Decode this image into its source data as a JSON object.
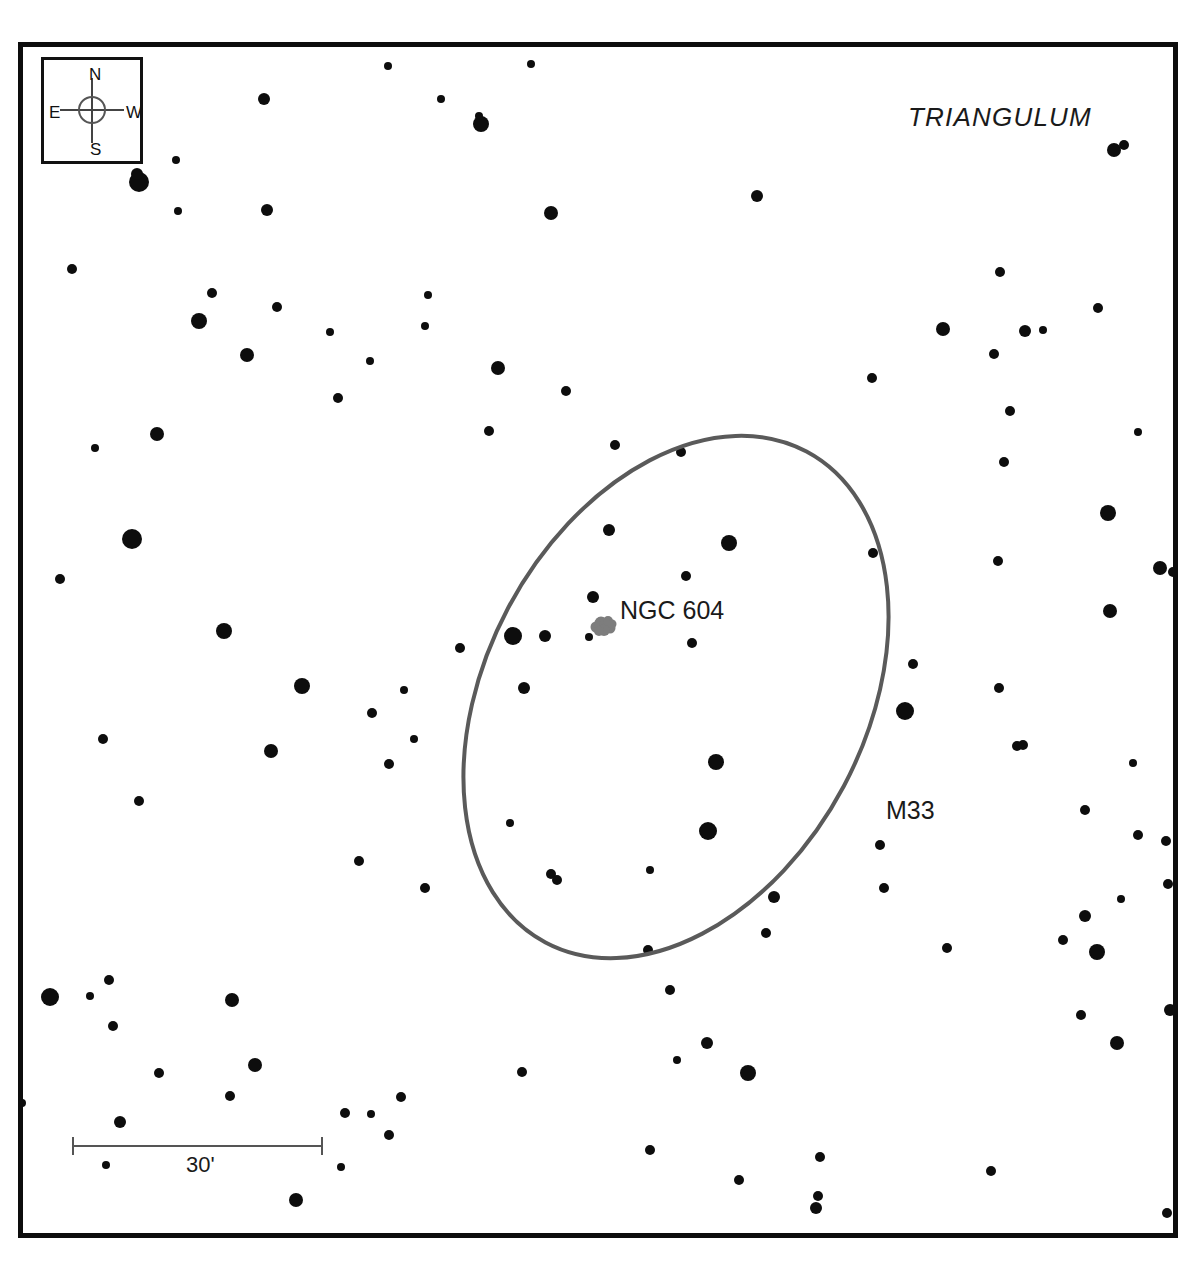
{
  "chart_data": {
    "type": "scatter",
    "title": "",
    "subtitle": "",
    "xlabel": "",
    "ylabel": "",
    "grid": false,
    "legend": "none",
    "field_size": "30 arcmin scale bar",
    "labels": {
      "constellation": "TRIANGULUM",
      "nebula": "NGC 604",
      "galaxy": "M33"
    },
    "compass": {
      "north": "N",
      "south": "S",
      "east": "E",
      "west": "W"
    },
    "scale": {
      "length_label": "30'",
      "pixel_length": 251
    },
    "colors": {
      "star": "#0d0d0d",
      "galaxy_outline": "#5a5a5a",
      "nebula": "#7d7d7d",
      "frame": "#0d0d0d",
      "background": "#ffffff",
      "text": "#1a1a1a"
    },
    "galaxy_ellipse": {
      "center_x": 676,
      "center_y": 697,
      "radius_major": 278,
      "radius_minor": 190,
      "rotation_deg": -62,
      "stroke_width": 4
    },
    "nebula_blob": {
      "x": 604,
      "y": 626
    },
    "stars": [
      {
        "x": 388,
        "y": 66,
        "r": 4
      },
      {
        "x": 531,
        "y": 64,
        "r": 4
      },
      {
        "x": 264,
        "y": 99,
        "r": 6
      },
      {
        "x": 441,
        "y": 99,
        "r": 4
      },
      {
        "x": 481,
        "y": 124,
        "r": 8
      },
      {
        "x": 479,
        "y": 116,
        "r": 4
      },
      {
        "x": 1114,
        "y": 150,
        "r": 7
      },
      {
        "x": 1124,
        "y": 145,
        "r": 5
      },
      {
        "x": 139,
        "y": 182,
        "r": 10
      },
      {
        "x": 137,
        "y": 174,
        "r": 6
      },
      {
        "x": 176,
        "y": 160,
        "r": 4
      },
      {
        "x": 178,
        "y": 211,
        "r": 4
      },
      {
        "x": 267,
        "y": 210,
        "r": 6
      },
      {
        "x": 551,
        "y": 213,
        "r": 7
      },
      {
        "x": 757,
        "y": 196,
        "r": 6
      },
      {
        "x": 72,
        "y": 269,
        "r": 5
      },
      {
        "x": 212,
        "y": 293,
        "r": 5
      },
      {
        "x": 277,
        "y": 307,
        "r": 5
      },
      {
        "x": 428,
        "y": 295,
        "r": 4
      },
      {
        "x": 1000,
        "y": 272,
        "r": 5
      },
      {
        "x": 1098,
        "y": 308,
        "r": 5
      },
      {
        "x": 199,
        "y": 321,
        "r": 8
      },
      {
        "x": 247,
        "y": 355,
        "r": 7
      },
      {
        "x": 370,
        "y": 361,
        "r": 4
      },
      {
        "x": 498,
        "y": 368,
        "r": 7
      },
      {
        "x": 943,
        "y": 329,
        "r": 7
      },
      {
        "x": 1025,
        "y": 331,
        "r": 6
      },
      {
        "x": 1043,
        "y": 330,
        "r": 4
      },
      {
        "x": 330,
        "y": 332,
        "r": 4
      },
      {
        "x": 425,
        "y": 326,
        "r": 4
      },
      {
        "x": 566,
        "y": 391,
        "r": 5
      },
      {
        "x": 872,
        "y": 378,
        "r": 5
      },
      {
        "x": 994,
        "y": 354,
        "r": 5
      },
      {
        "x": 338,
        "y": 398,
        "r": 5
      },
      {
        "x": 489,
        "y": 431,
        "r": 5
      },
      {
        "x": 157,
        "y": 434,
        "r": 7
      },
      {
        "x": 615,
        "y": 445,
        "r": 5
      },
      {
        "x": 681,
        "y": 452,
        "r": 5
      },
      {
        "x": 1010,
        "y": 411,
        "r": 5
      },
      {
        "x": 1138,
        "y": 432,
        "r": 4
      },
      {
        "x": 95,
        "y": 448,
        "r": 4
      },
      {
        "x": 1004,
        "y": 462,
        "r": 5
      },
      {
        "x": 132,
        "y": 539,
        "r": 10
      },
      {
        "x": 609,
        "y": 530,
        "r": 6
      },
      {
        "x": 729,
        "y": 543,
        "r": 8
      },
      {
        "x": 873,
        "y": 553,
        "r": 5
      },
      {
        "x": 1108,
        "y": 513,
        "r": 8
      },
      {
        "x": 1160,
        "y": 568,
        "r": 7
      },
      {
        "x": 1173,
        "y": 572,
        "r": 5
      },
      {
        "x": 60,
        "y": 579,
        "r": 5
      },
      {
        "x": 686,
        "y": 576,
        "r": 5
      },
      {
        "x": 593,
        "y": 597,
        "r": 6
      },
      {
        "x": 998,
        "y": 561,
        "r": 5
      },
      {
        "x": 1110,
        "y": 611,
        "r": 7
      },
      {
        "x": 224,
        "y": 631,
        "r": 8
      },
      {
        "x": 513,
        "y": 636,
        "r": 9
      },
      {
        "x": 545,
        "y": 636,
        "r": 6
      },
      {
        "x": 460,
        "y": 648,
        "r": 5
      },
      {
        "x": 589,
        "y": 637,
        "r": 4
      },
      {
        "x": 692,
        "y": 643,
        "r": 5
      },
      {
        "x": 913,
        "y": 664,
        "r": 5
      },
      {
        "x": 302,
        "y": 686,
        "r": 8
      },
      {
        "x": 404,
        "y": 690,
        "r": 4
      },
      {
        "x": 524,
        "y": 688,
        "r": 6
      },
      {
        "x": 372,
        "y": 713,
        "r": 5
      },
      {
        "x": 905,
        "y": 711,
        "r": 9
      },
      {
        "x": 999,
        "y": 688,
        "r": 5
      },
      {
        "x": 1023,
        "y": 745,
        "r": 5
      },
      {
        "x": 103,
        "y": 739,
        "r": 5
      },
      {
        "x": 271,
        "y": 751,
        "r": 7
      },
      {
        "x": 414,
        "y": 739,
        "r": 4
      },
      {
        "x": 389,
        "y": 764,
        "r": 5
      },
      {
        "x": 716,
        "y": 762,
        "r": 8
      },
      {
        "x": 1017,
        "y": 746,
        "r": 5
      },
      {
        "x": 1133,
        "y": 763,
        "r": 4
      },
      {
        "x": 1085,
        "y": 810,
        "r": 5
      },
      {
        "x": 139,
        "y": 801,
        "r": 5
      },
      {
        "x": 510,
        "y": 823,
        "r": 4
      },
      {
        "x": 708,
        "y": 831,
        "r": 9
      },
      {
        "x": 880,
        "y": 845,
        "r": 5
      },
      {
        "x": 1138,
        "y": 835,
        "r": 5
      },
      {
        "x": 1166,
        "y": 841,
        "r": 5
      },
      {
        "x": 359,
        "y": 861,
        "r": 5
      },
      {
        "x": 425,
        "y": 888,
        "r": 5
      },
      {
        "x": 551,
        "y": 874,
        "r": 5
      },
      {
        "x": 557,
        "y": 880,
        "r": 5
      },
      {
        "x": 650,
        "y": 870,
        "r": 4
      },
      {
        "x": 774,
        "y": 897,
        "r": 6
      },
      {
        "x": 884,
        "y": 888,
        "r": 5
      },
      {
        "x": 1168,
        "y": 884,
        "r": 5
      },
      {
        "x": 1085,
        "y": 916,
        "r": 6
      },
      {
        "x": 1121,
        "y": 899,
        "r": 4
      },
      {
        "x": 766,
        "y": 933,
        "r": 5
      },
      {
        "x": 1063,
        "y": 940,
        "r": 5
      },
      {
        "x": 648,
        "y": 950,
        "r": 5
      },
      {
        "x": 947,
        "y": 948,
        "r": 5
      },
      {
        "x": 1097,
        "y": 952,
        "r": 8
      },
      {
        "x": 50,
        "y": 997,
        "r": 9
      },
      {
        "x": 90,
        "y": 996,
        "r": 4
      },
      {
        "x": 109,
        "y": 980,
        "r": 5
      },
      {
        "x": 113,
        "y": 1026,
        "r": 5
      },
      {
        "x": 670,
        "y": 990,
        "r": 5
      },
      {
        "x": 1081,
        "y": 1015,
        "r": 5
      },
      {
        "x": 1170,
        "y": 1010,
        "r": 6
      },
      {
        "x": 232,
        "y": 1000,
        "r": 7
      },
      {
        "x": 255,
        "y": 1065,
        "r": 7
      },
      {
        "x": 707,
        "y": 1043,
        "r": 6
      },
      {
        "x": 1117,
        "y": 1043,
        "r": 7
      },
      {
        "x": 677,
        "y": 1060,
        "r": 4
      },
      {
        "x": 159,
        "y": 1073,
        "r": 5
      },
      {
        "x": 522,
        "y": 1072,
        "r": 5
      },
      {
        "x": 748,
        "y": 1073,
        "r": 8
      },
      {
        "x": 230,
        "y": 1096,
        "r": 5
      },
      {
        "x": 401,
        "y": 1097,
        "r": 5
      },
      {
        "x": 389,
        "y": 1135,
        "r": 5
      },
      {
        "x": 345,
        "y": 1113,
        "r": 5
      },
      {
        "x": 371,
        "y": 1114,
        "r": 4
      },
      {
        "x": 120,
        "y": 1122,
        "r": 6
      },
      {
        "x": 650,
        "y": 1150,
        "r": 5
      },
      {
        "x": 820,
        "y": 1157,
        "r": 5
      },
      {
        "x": 106,
        "y": 1165,
        "r": 4
      },
      {
        "x": 341,
        "y": 1167,
        "r": 4
      },
      {
        "x": 739,
        "y": 1180,
        "r": 5
      },
      {
        "x": 991,
        "y": 1171,
        "r": 5
      },
      {
        "x": 296,
        "y": 1200,
        "r": 7
      },
      {
        "x": 818,
        "y": 1196,
        "r": 5
      },
      {
        "x": 816,
        "y": 1208,
        "r": 6
      },
      {
        "x": 1167,
        "y": 1213,
        "r": 5
      },
      {
        "x": 22,
        "y": 1103,
        "r": 4
      },
      {
        "x": 1181,
        "y": 1147,
        "r": 5
      }
    ]
  }
}
